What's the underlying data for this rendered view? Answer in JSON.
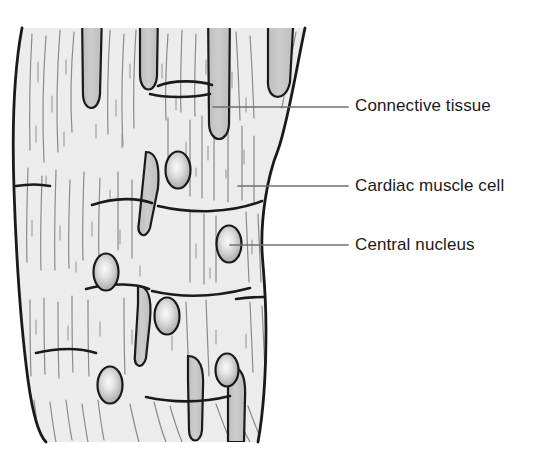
{
  "figure": {
    "width": 551,
    "height": 472,
    "background_color": "#ffffff"
  },
  "colors": {
    "tissue_fill": "#ececec",
    "connective_band_fill": "#c9c9c9",
    "nucleus_fill": "#b8b8b8",
    "nucleus_highlight": "#f2f2f2",
    "outline": "#1a1a1a",
    "striation": "#8a8a8a",
    "leader_line": "#6f6f6f",
    "label_text": "#1a1a1a"
  },
  "labels": [
    {
      "id": "connective-tissue",
      "text": "Connective tissue",
      "leader": {
        "x1": 213,
        "y1": 107,
        "x2": 348,
        "y2": 107
      }
    },
    {
      "id": "cardiac-muscle-cell",
      "text": "Cardiac muscle cell",
      "leader": {
        "x1": 238,
        "y1": 186,
        "x2": 348,
        "y2": 186
      }
    },
    {
      "id": "central-nucleus",
      "text": "Central nucleus",
      "leader": {
        "x1": 230,
        "y1": 245,
        "x2": 348,
        "y2": 245
      }
    }
  ],
  "structures": {
    "tissue_band": {
      "name": "cardiac muscle tissue band",
      "outline_path": "M 22 28 C 14 70 12 130 14 190 C 16 250 20 320 28 380 C 33 416 40 436 46 442 L 258 442 C 262 420 266 380 266 330 C 266 290 263 270 262 250 C 261 220 266 180 278 150 C 288 122 298 60 305 28 Z"
    },
    "connective_tissue_bands": [
      {
        "id": "band-1",
        "cx": 92,
        "cy": 62,
        "rx": 10,
        "ry": 52
      },
      {
        "id": "band-2",
        "cx": 148,
        "cy": 48,
        "rx": 10,
        "ry": 46
      },
      {
        "id": "band-3",
        "cx": 219,
        "cy": 70,
        "rx": 11,
        "ry": 62
      },
      {
        "id": "band-4",
        "cx": 280,
        "cy": 52,
        "rx": 13,
        "ry": 50
      },
      {
        "id": "band-5",
        "cx": 152,
        "cy": 190,
        "rx": 9,
        "ry": 42
      },
      {
        "id": "band-6",
        "cx": 144,
        "cy": 320,
        "rx": 9,
        "ry": 42
      },
      {
        "id": "band-7",
        "cx": 196,
        "cy": 400,
        "rx": 9,
        "ry": 42
      },
      {
        "id": "band-8",
        "cx": 236,
        "cy": 408,
        "rx": 9,
        "ry": 38
      }
    ],
    "nuclei": [
      {
        "id": "nucleus-1",
        "cx": 178,
        "cy": 170,
        "rx": 12,
        "ry": 18
      },
      {
        "id": "nucleus-2",
        "cx": 229,
        "cy": 244,
        "rx": 12,
        "ry": 18
      },
      {
        "id": "nucleus-3",
        "cx": 106,
        "cy": 272,
        "rx": 12,
        "ry": 18
      },
      {
        "id": "nucleus-4",
        "cx": 167,
        "cy": 316,
        "rx": 12,
        "ry": 18
      },
      {
        "id": "nucleus-5",
        "cx": 110,
        "cy": 385,
        "rx": 12,
        "ry": 18
      },
      {
        "id": "nucleus-6",
        "cx": 227,
        "cy": 370,
        "rx": 11,
        "ry": 16
      }
    ],
    "intercalated_discs": [
      {
        "id": "disc-1",
        "path": "M 158 86 C 170 80 200 80 212 84"
      },
      {
        "id": "disc-2",
        "path": "M 152 92 C 160 96 190 96 212 93"
      },
      {
        "id": "disc-3",
        "path": "M 92 204 C 120 196 140 198 155 202"
      },
      {
        "id": "disc-4",
        "path": "M 152 204 C 190 212 230 212 262 202"
      },
      {
        "id": "disc-5",
        "path": "M 88 288 C 115 282 140 284 150 288"
      },
      {
        "id": "disc-6",
        "path": "M 150 290 C 180 296 215 296 250 288"
      },
      {
        "id": "disc-7",
        "path": "M 38 352 C 60 348 80 348 96 352"
      },
      {
        "id": "disc-8",
        "path": "M 146 396 C 175 402 205 402 234 396"
      },
      {
        "id": "disc-9",
        "path": "M 236 300 C 248 298 256 298 263 298"
      }
    ]
  }
}
